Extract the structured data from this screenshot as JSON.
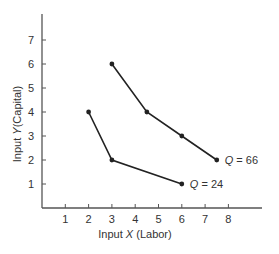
{
  "chart_data": {
    "type": "line",
    "title": "",
    "xlabel": "Input X (Labor)",
    "ylabel": "Input Y (Capital)",
    "xlabel_parts": {
      "prefix": "Input ",
      "var": "X",
      "suffix": " (Labor)"
    },
    "ylabel_parts": {
      "prefix": "Input ",
      "var": "Y",
      "suffix": "(Capital)"
    },
    "xlim": [
      0,
      9.3
    ],
    "ylim": [
      0,
      8.1
    ],
    "xticks": [
      1,
      2,
      3,
      4,
      5,
      6,
      7,
      8
    ],
    "yticks": [
      1,
      2,
      3,
      4,
      5,
      6,
      7
    ],
    "grid": false,
    "legend": "inline labels at curve ends",
    "series": [
      {
        "name": "Q = 24",
        "label_var": "Q",
        "label_value": "= 24",
        "points": [
          [
            2,
            4
          ],
          [
            3,
            2
          ],
          [
            6,
            1
          ]
        ]
      },
      {
        "name": "Q = 66",
        "label_var": "Q",
        "label_value": "= 66",
        "points": [
          [
            3,
            6
          ],
          [
            4.5,
            4
          ],
          [
            6,
            3
          ],
          [
            7.5,
            2
          ]
        ]
      }
    ],
    "colors": {
      "line": "#222222",
      "axis": "#555555",
      "text": "#333333"
    }
  }
}
